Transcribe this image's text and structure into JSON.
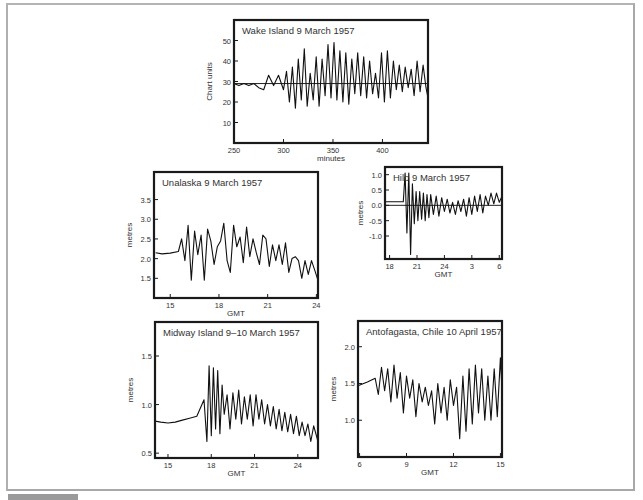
{
  "page": {
    "caption": "",
    "colors": {
      "frame": "#a8a8a8",
      "axis": "#1a1a1a",
      "trace": "#111111",
      "text": "#333333"
    }
  },
  "chart_data": [
    {
      "id": "wake",
      "type": "line",
      "title": "Wake Island  9 March 1957",
      "xlabel": "minutes",
      "ylabel": "Chart units",
      "xticks": [
        250,
        300,
        350,
        400
      ],
      "xtick_labels": [
        "250",
        "300",
        "350",
        "400"
      ],
      "yticks": [
        10,
        20,
        30,
        40,
        50
      ],
      "ytick_labels": [
        "10",
        "20",
        "30",
        "40",
        "50"
      ],
      "xlim": [
        250,
        446
      ],
      "ylim": [
        0,
        60
      ],
      "reference_line": 29,
      "frame": {
        "x": 234,
        "y": 20,
        "w": 194,
        "h": 123
      },
      "series": [
        {
          "name": "tide gauge",
          "x": [
            250,
            255,
            260,
            265,
            270,
            275,
            280,
            285,
            290,
            295,
            300,
            303,
            306,
            309,
            312,
            315,
            318,
            321,
            324,
            327,
            330,
            333,
            336,
            339,
            342,
            345,
            348,
            351,
            354,
            357,
            360,
            363,
            366,
            369,
            372,
            375,
            378,
            381,
            384,
            387,
            390,
            393,
            396,
            399,
            402,
            405,
            408,
            411,
            414,
            417,
            420,
            423,
            426,
            429,
            432,
            435,
            438,
            441,
            444,
            446
          ],
          "y": [
            29,
            28,
            29,
            28,
            29,
            27,
            26,
            33,
            28,
            33,
            26,
            35,
            20,
            37,
            17,
            41,
            21,
            46,
            18,
            34,
            21,
            42,
            18,
            41,
            23,
            48,
            22,
            49,
            21,
            45,
            20,
            44,
            19,
            41,
            24,
            44,
            23,
            42,
            22,
            40,
            24,
            34,
            22,
            44,
            20,
            45,
            22,
            40,
            26,
            38,
            25,
            37,
            27,
            36,
            23,
            40,
            25,
            38,
            27,
            22
          ]
        }
      ]
    },
    {
      "id": "unalaska",
      "type": "line",
      "title": "Unalaska  9 March 1957",
      "xlabel": "GMT",
      "ylabel": "metres",
      "xticks": [
        15,
        18,
        21,
        24
      ],
      "xtick_labels": [
        "15",
        "18",
        "21",
        "24"
      ],
      "yticks": [
        1.5,
        2.0,
        2.5,
        3.0,
        3.5
      ],
      "ytick_labels": [
        "1.5",
        "2.0",
        "2.5",
        "3.0",
        "3.5"
      ],
      "xlim": [
        14,
        24.1
      ],
      "ylim": [
        1.0,
        4.2
      ],
      "frame": {
        "x": 154,
        "y": 172,
        "w": 164,
        "h": 126
      },
      "series": [
        {
          "name": "tide gauge",
          "x": [
            14.1,
            14.5,
            15,
            15.5,
            15.7,
            15.9,
            16.1,
            16.3,
            16.5,
            16.7,
            16.9,
            17.1,
            17.3,
            17.5,
            17.7,
            17.9,
            18.1,
            18.3,
            18.5,
            18.7,
            18.9,
            19.1,
            19.3,
            19.5,
            19.7,
            19.9,
            20.1,
            20.3,
            20.5,
            20.7,
            20.9,
            21.1,
            21.3,
            21.5,
            21.7,
            21.9,
            22.1,
            22.3,
            22.5,
            22.7,
            22.9,
            23.1,
            23.3,
            23.5,
            23.7,
            23.9,
            24.1
          ],
          "y": [
            2.15,
            2.12,
            2.14,
            2.18,
            2.5,
            1.95,
            2.85,
            1.45,
            2.7,
            2.1,
            2.6,
            1.45,
            2.75,
            2.45,
            1.85,
            2.3,
            2.45,
            2.9,
            1.95,
            1.65,
            2.85,
            2.3,
            2.55,
            1.9,
            2.8,
            2.05,
            2.5,
            2.15,
            1.85,
            2.6,
            2.5,
            1.8,
            2.35,
            1.95,
            2.35,
            1.85,
            2.4,
            1.65,
            2.0,
            2.05,
            1.95,
            1.5,
            1.95,
            1.6,
            1.95,
            1.7,
            1.45
          ]
        }
      ]
    },
    {
      "id": "hilo",
      "type": "line",
      "title": "Hilo  9 March 1957",
      "xlabel": "GMT",
      "ylabel": "metres",
      "xticks": [
        18,
        21,
        24,
        27,
        30
      ],
      "xtick_labels": [
        "18",
        "21",
        "24",
        "3",
        "6"
      ],
      "yticks": [
        -1.0,
        -0.5,
        0.0,
        0.5,
        1.0
      ],
      "ytick_labels": [
        "-1.0",
        "-0.5",
        "0.0",
        "0.5",
        "1.0"
      ],
      "xlim": [
        17.5,
        30.3
      ],
      "ylim": [
        -1.75,
        1.25
      ],
      "reference_line": 0,
      "frame": {
        "x": 385,
        "y": 167,
        "w": 117,
        "h": 92
      },
      "series": [
        {
          "name": "tide gauge",
          "x": [
            17.5,
            18.5,
            19.5,
            19.7,
            19.9,
            20.1,
            20.3,
            20.5,
            20.7,
            20.9,
            21.1,
            21.3,
            21.5,
            21.7,
            21.9,
            22.1,
            22.3,
            22.5,
            22.8,
            23.1,
            23.4,
            23.7,
            24,
            24.3,
            24.6,
            24.9,
            25.2,
            25.5,
            25.8,
            26.1,
            26.4,
            26.7,
            27,
            27.3,
            27.6,
            27.9,
            28.2,
            28.5,
            28.8,
            29.1,
            29.4,
            29.7,
            30,
            30.3
          ],
          "y": [
            0.12,
            0.12,
            0.12,
            1.05,
            -0.9,
            1.05,
            -1.6,
            0.7,
            -0.6,
            0.45,
            -0.5,
            0.45,
            -0.45,
            0.4,
            -0.5,
            0.35,
            -0.4,
            0.35,
            -0.3,
            0.3,
            -0.35,
            0.25,
            -0.2,
            0.2,
            -0.25,
            0.1,
            -0.3,
            0.15,
            -0.2,
            0.2,
            -0.35,
            0.25,
            -0.3,
            0.3,
            -0.2,
            0.35,
            -0.25,
            0.3,
            0.0,
            0.4,
            0.05,
            0.4,
            0.1,
            0.3
          ]
        }
      ]
    },
    {
      "id": "midway",
      "type": "line",
      "title": "Midway Island  9–10 March 1957",
      "xlabel": "GMT",
      "ylabel": "metres",
      "xticks": [
        15,
        18,
        21,
        24
      ],
      "xtick_labels": [
        "15",
        "18",
        "21",
        "24"
      ],
      "yticks": [
        0.5,
        1.0,
        1.5
      ],
      "ytick_labels": [
        "0.5",
        "1.0",
        "1.5"
      ],
      "xlim": [
        14.1,
        25.4
      ],
      "ylim": [
        0.45,
        1.85
      ],
      "frame": {
        "x": 155,
        "y": 322,
        "w": 163,
        "h": 136
      },
      "series": [
        {
          "name": "tide gauge",
          "x": [
            14.1,
            14.5,
            15,
            15.5,
            16,
            16.5,
            17,
            17.5,
            17.7,
            17.85,
            18,
            18.15,
            18.3,
            18.45,
            18.6,
            18.75,
            18.9,
            19.1,
            19.3,
            19.5,
            19.7,
            19.9,
            20.1,
            20.3,
            20.5,
            20.7,
            20.9,
            21.1,
            21.3,
            21.5,
            21.7,
            21.9,
            22.1,
            22.3,
            22.5,
            22.7,
            22.9,
            23.1,
            23.3,
            23.5,
            23.7,
            23.9,
            24.1,
            24.3,
            24.5,
            24.7,
            24.9,
            25.1,
            25.4
          ],
          "y": [
            0.83,
            0.82,
            0.81,
            0.82,
            0.84,
            0.86,
            0.88,
            1.05,
            0.62,
            1.4,
            0.68,
            1.38,
            0.75,
            1.35,
            0.7,
            1.2,
            0.9,
            1.1,
            0.75,
            1.12,
            0.85,
            1.15,
            0.8,
            1.08,
            0.85,
            1.1,
            0.78,
            1.1,
            0.85,
            1.05,
            0.8,
            1.0,
            0.78,
            0.98,
            0.75,
            0.95,
            0.73,
            0.92,
            0.72,
            0.9,
            0.7,
            0.88,
            0.68,
            0.82,
            0.68,
            0.8,
            0.62,
            0.78,
            0.62
          ]
        }
      ]
    },
    {
      "id": "antofagasta",
      "type": "line",
      "title": "Antofagasta, Chile  10 April 1957",
      "xlabel": "GMT",
      "ylabel": "metres",
      "xticks": [
        6,
        9,
        12,
        15
      ],
      "xtick_labels": [
        "6",
        "9",
        "12",
        "15"
      ],
      "yticks": [
        1.0,
        1.5,
        2.0
      ],
      "ytick_labels": [
        "1.0",
        "1.5",
        "2.0"
      ],
      "xlim": [
        5.9,
        15.1
      ],
      "ylim": [
        0.5,
        2.35
      ],
      "frame": {
        "x": 358,
        "y": 321,
        "w": 144,
        "h": 136
      },
      "series": [
        {
          "name": "tide gauge",
          "x": [
            5.9,
            6.5,
            7,
            7.2,
            7.4,
            7.6,
            7.8,
            8,
            8.2,
            8.4,
            8.6,
            8.8,
            9,
            9.2,
            9.4,
            9.6,
            9.8,
            10,
            10.2,
            10.4,
            10.6,
            10.8,
            11,
            11.2,
            11.4,
            11.6,
            11.8,
            12,
            12.2,
            12.4,
            12.6,
            12.8,
            13,
            13.2,
            13.4,
            13.6,
            13.8,
            14,
            14.2,
            14.4,
            14.6,
            14.8,
            15,
            15.1
          ],
          "y": [
            1.47,
            1.52,
            1.57,
            1.35,
            1.72,
            1.4,
            1.7,
            1.25,
            1.75,
            1.3,
            1.65,
            1.1,
            1.6,
            1.3,
            1.55,
            1.05,
            1.5,
            1.25,
            1.45,
            1.2,
            1.4,
            0.95,
            1.5,
            1.1,
            1.45,
            1.0,
            1.55,
            1.2,
            1.45,
            0.75,
            1.6,
            0.85,
            1.7,
            0.95,
            1.75,
            1.1,
            1.7,
            1.0,
            1.6,
            1.0,
            1.7,
            1.05,
            1.85,
            1.4
          ]
        }
      ]
    }
  ]
}
